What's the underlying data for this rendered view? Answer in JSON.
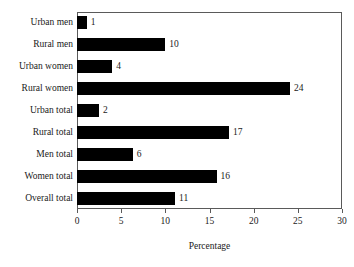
{
  "chart_data": {
    "type": "bar",
    "orientation": "horizontal",
    "title": "",
    "xlabel": "Percentage",
    "ylabel": "",
    "xlim": [
      0,
      30
    ],
    "xticks": [
      0,
      5,
      10,
      15,
      20,
      25,
      30
    ],
    "grid": false,
    "legend": null,
    "bar_color": "#000000",
    "frame_color": "#5a5a5a",
    "background_color": "#ffffff",
    "categories": [
      "Urban men",
      "Rural men",
      "Urban women",
      "Rural women",
      "Urban total",
      "Rural total",
      "Men total",
      "Women total",
      "Overall total"
    ],
    "values": [
      1,
      10,
      4,
      24,
      2,
      17,
      6,
      16,
      11
    ],
    "data_labels": [
      "1",
      "10",
      "4",
      "24",
      "2",
      "17",
      "6",
      "16",
      "11"
    ],
    "bars": [
      {
        "category": "Urban men",
        "value": 1,
        "label": "1",
        "drawn_length": 1.1
      },
      {
        "category": "Rural men",
        "value": 10,
        "label": "10",
        "drawn_length": 10.0
      },
      {
        "category": "Urban women",
        "value": 4,
        "label": "4",
        "drawn_length": 4.0
      },
      {
        "category": "Rural women",
        "value": 24,
        "label": "24",
        "drawn_length": 24.1
      },
      {
        "category": "Urban total",
        "value": 2,
        "label": "2",
        "drawn_length": 2.5
      },
      {
        "category": "Rural total",
        "value": 17,
        "label": "17",
        "drawn_length": 17.2
      },
      {
        "category": "Men total",
        "value": 6,
        "label": "6",
        "drawn_length": 6.3
      },
      {
        "category": "Women total",
        "value": 16,
        "label": "16",
        "drawn_length": 15.8
      },
      {
        "category": "Overall total",
        "value": 11,
        "label": "11",
        "drawn_length": 11.1
      }
    ]
  }
}
